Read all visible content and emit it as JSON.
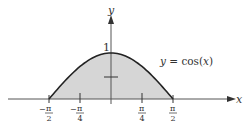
{
  "chart_data": {
    "type": "area",
    "title": "",
    "function_label": "y = cos(x)",
    "xlabel": "x",
    "ylabel": "y",
    "x_ticks": [
      {
        "value": -1.5708,
        "label_num": "π",
        "label_den": "2",
        "sign": "−"
      },
      {
        "value": -0.7854,
        "label_num": "π",
        "label_den": "4",
        "sign": "−"
      },
      {
        "value": 0.7854,
        "label_num": "π",
        "label_den": "4",
        "sign": ""
      },
      {
        "value": 1.5708,
        "label_num": "π",
        "label_den": "2",
        "sign": ""
      }
    ],
    "y_ticks": [
      {
        "value": 0.5,
        "label": ""
      },
      {
        "value": 1,
        "label": "1"
      }
    ],
    "shaded_region": {
      "from": -1.5708,
      "to": 1.5708
    },
    "x": [
      -1.5708,
      -1.1781,
      -0.7854,
      -0.3927,
      0,
      0.3927,
      0.7854,
      1.1781,
      1.5708
    ],
    "values": [
      0,
      0.3827,
      0.7071,
      0.9239,
      1,
      0.9239,
      0.7071,
      0.3827,
      0
    ],
    "colors": {
      "fill": "#d6d6d6",
      "curve": "#222222",
      "axis": "#444444"
    }
  },
  "labels": {
    "y_axis": "y",
    "x_axis": "x",
    "one": "1",
    "func_y": "y",
    "func_eq": " = cos(",
    "func_x": "x",
    "func_close": ")",
    "pi": "π",
    "minus": "−",
    "den2": "2",
    "den4": "4"
  }
}
